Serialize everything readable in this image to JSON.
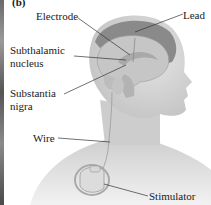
{
  "figure": {
    "panel_label": "(b)",
    "labels": {
      "electrode": "Electrode",
      "lead": "Lead",
      "subthalamic_line1": "Subthalamic",
      "subthalamic_line2": "nucleus",
      "substantia_line1": "Substantia",
      "substantia_line2": "nigra",
      "wire": "Wire",
      "stimulator": "Stimulator"
    },
    "colors": {
      "skin": "#d8d8d8",
      "brain": "#c8c8c8",
      "skull": "#8a8a8a",
      "leader_line": "#333333"
    }
  }
}
